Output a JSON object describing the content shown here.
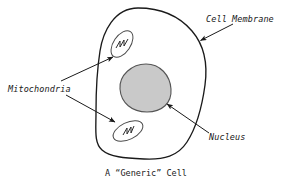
{
  "figure": {
    "caption": "A “Generic” Cell",
    "background_color": "#ffffff",
    "stroke_color": "#1a1a1a"
  },
  "labels": {
    "cell_membrane": "Cell Membrane",
    "mitochondria": "Mitochondria",
    "nucleus": "Nucleus"
  },
  "structures": {
    "cell_membrane": {
      "name": "cell-membrane-outline",
      "fill": "#ffffff",
      "stroke": "#1a1a1a"
    },
    "nucleus": {
      "name": "nucleus-shape",
      "fill": "#c9c9c9",
      "stroke": "#555555"
    },
    "mitochondrion_upper": {
      "name": "mitochondrion-upper",
      "fill": "#ffffff",
      "stroke": "#4a4a4a"
    },
    "mitochondrion_lower": {
      "name": "mitochondrion-lower",
      "fill": "#ffffff",
      "stroke": "#4a4a4a"
    }
  },
  "pointers": {
    "cell_membrane": "arrow-to-cell-membrane",
    "mitochondria_upper": "arrow-to-mitochondrion-upper",
    "mitochondria_lower": "arrow-to-mitochondrion-lower",
    "nucleus": "arrow-to-nucleus"
  }
}
